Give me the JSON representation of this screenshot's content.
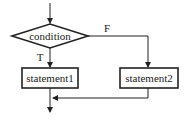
{
  "diagram": {
    "type": "flowchart",
    "decision": {
      "label": "condition"
    },
    "branches": {
      "true_label": "T",
      "false_label": "F"
    },
    "process1": {
      "label": "statement1"
    },
    "process2": {
      "label": "statement2"
    }
  }
}
